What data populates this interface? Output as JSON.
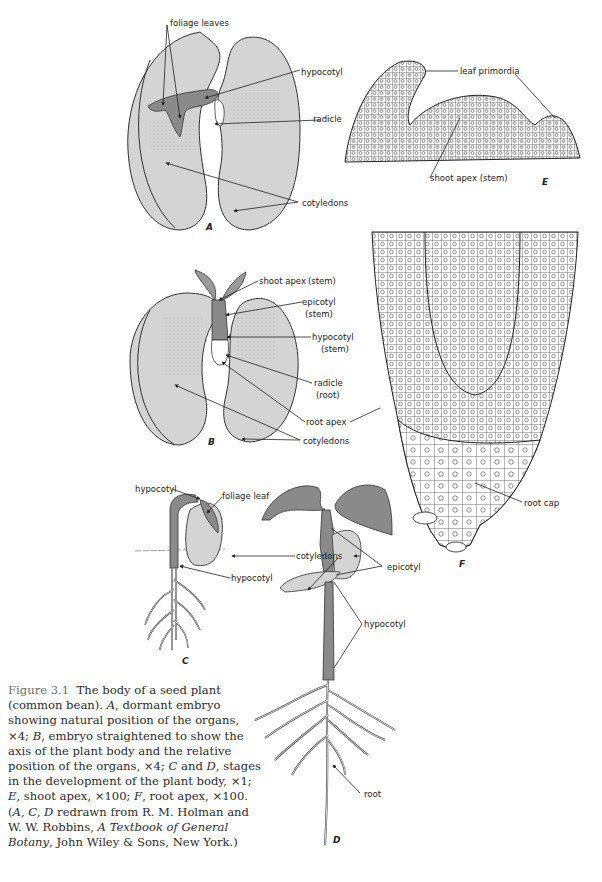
{
  "figure": {
    "number": "Figure 3.1",
    "caption_parts": [
      {
        "t": "The body of a seed plant (common bean). ",
        "i": false
      },
      {
        "t": "A",
        "i": true
      },
      {
        "t": ", dormant embryo showing natural position of the organs, ×4; ",
        "i": false
      },
      {
        "t": "B",
        "i": true
      },
      {
        "t": ", embryo straightened to show the axis of the plant body and the relative position of the organs, ×4; ",
        "i": false
      },
      {
        "t": "C",
        "i": true
      },
      {
        "t": " and ",
        "i": false
      },
      {
        "t": "D",
        "i": true
      },
      {
        "t": ", stages in the development of the plant body, ×1; ",
        "i": false
      },
      {
        "t": "E",
        "i": true
      },
      {
        "t": ", shoot apex, ×100; ",
        "i": false
      },
      {
        "t": "F",
        "i": true
      },
      {
        "t": ", root apex, ×100. (",
        "i": false
      },
      {
        "t": "A, C, D",
        "i": true
      },
      {
        "t": " redrawn from R. M. Holman and W. W. Robbins, ",
        "i": false
      },
      {
        "t": "A Textbook of General Botany",
        "i": true
      },
      {
        "t": ", John Wiley & Sons, New York.)",
        "i": false
      }
    ]
  },
  "colors": {
    "cotyledon_fill": "#d4d4d4",
    "stem_fill": "#8a8a8a",
    "leaf_fill": "#9a9a9a",
    "outline": "#333333"
  },
  "panels": {
    "A": {
      "letter": "A",
      "labels": {
        "foliage_leaves": "foliage leaves",
        "hypocotyl": "hypocotyl",
        "radicle": "radicle",
        "cotyledons": "cotyledons"
      }
    },
    "B": {
      "letter": "B",
      "labels": {
        "shoot_apex": "shoot apex",
        "shoot_apex_qual": "(stem)",
        "epicotyl": "epicotyl",
        "epicotyl_qual": "(stem)",
        "hypocotyl": "hypocotyl",
        "hypocotyl_qual": "(stem)",
        "radicle": "radicle",
        "radicle_qual": "(root)",
        "root_apex": "root apex",
        "cotyledons": "cotyledons"
      }
    },
    "C": {
      "letter": "C",
      "labels": {
        "hypocotyl_top": "hypocotyl",
        "foliage_leaf": "foliage leaf",
        "hypocotyl_bottom": "hypocotyl"
      }
    },
    "D": {
      "letter": "D",
      "labels": {
        "cotyledons": "cotyledons",
        "epicotyl": "epicotyl",
        "hypocotyl": "hypocotyl",
        "root": "root"
      }
    },
    "E": {
      "letter": "E",
      "labels": {
        "leaf_primordia": "leaf primordia",
        "shoot_apex": "shoot apex (stem)"
      }
    },
    "F": {
      "letter": "F",
      "labels": {
        "root_cap": "root cap"
      }
    }
  }
}
